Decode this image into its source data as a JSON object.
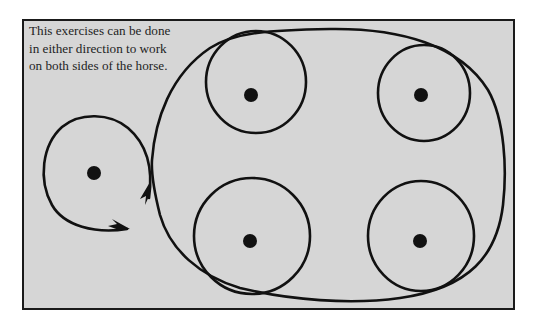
{
  "caption": {
    "lines": [
      "This exercises can be done",
      "in either direction to work",
      "on both sides of the horse."
    ]
  },
  "diagram": {
    "background_color": "#d6d6d6",
    "stroke_color": "#111111",
    "circles": [
      {
        "name": "left-small-circle",
        "cx": 94,
        "cy": 173
      },
      {
        "name": "top-left-circle",
        "cx": 251,
        "cy": 95
      },
      {
        "name": "top-right-circle",
        "cx": 421,
        "cy": 95
      },
      {
        "name": "bottom-left-circle",
        "cx": 250,
        "cy": 241
      },
      {
        "name": "bottom-right-circle",
        "cx": 420,
        "cy": 241
      }
    ],
    "arrows": [
      {
        "name": "up-arrow",
        "direction": "up"
      },
      {
        "name": "right-arrow",
        "direction": "right"
      }
    ]
  }
}
